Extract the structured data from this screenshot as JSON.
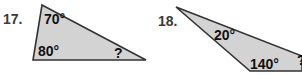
{
  "problems": [
    {
      "number": "17.",
      "angles": {
        "top": "70°",
        "bottom_left": "80°",
        "bottom_right": "?"
      },
      "fill_color": "#d3d3d3",
      "stroke_color": "#333333"
    },
    {
      "number": "18.",
      "angles": {
        "top_left": "20°",
        "bottom": "140°",
        "right": "?"
      },
      "fill_color": "#d3d3d3",
      "stroke_color": "#333333"
    }
  ]
}
